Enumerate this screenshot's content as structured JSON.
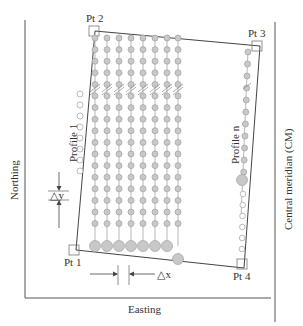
{
  "diagram": {
    "type": "survey-grid",
    "axes": {
      "y_label": "Northing",
      "x_label": "Easting",
      "right_label": "Central meridian (CM)"
    },
    "corners": [
      {
        "id": "pt1",
        "label": "Pt 1"
      },
      {
        "id": "pt2",
        "label": "Pt 2"
      },
      {
        "id": "pt3",
        "label": "Pt 3"
      },
      {
        "id": "pt4",
        "label": "Pt 4"
      }
    ],
    "profiles": {
      "first": "Profile  1",
      "last": "Profile  n"
    },
    "spacing": {
      "dy": "△y",
      "dx": "△x"
    },
    "colors": {
      "line": "#444444",
      "dot_fill": "#c8c8c8",
      "dot_stroke": "#a0a0a0",
      "open_dot_fill": "#ffffff"
    }
  }
}
